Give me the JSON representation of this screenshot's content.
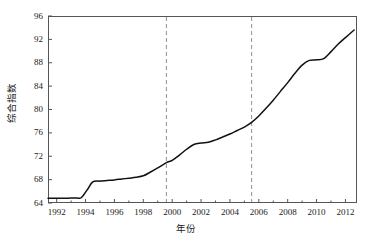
{
  "chart_data": {
    "type": "line",
    "title": "",
    "xlabel": "年份",
    "ylabel": "综合指数",
    "xlim": [
      1991.4,
      2012.8
    ],
    "ylim": [
      64,
      96
    ],
    "grid": false,
    "legend": null,
    "xticks": [
      1992,
      1994,
      1996,
      1998,
      2000,
      2002,
      2004,
      2006,
      2008,
      2010,
      2012
    ],
    "xtick_labels": [
      "1992",
      "1994",
      "1996",
      "1998",
      "2000",
      "2002",
      "2004",
      "2006",
      "2008",
      "2010",
      "2012"
    ],
    "yticks": [
      64,
      68,
      72,
      76,
      80,
      84,
      88,
      92,
      96
    ],
    "ytick_labels": [
      "64",
      "68",
      "72",
      "76",
      "80",
      "84",
      "88",
      "92",
      "96"
    ],
    "line_color": "#111111",
    "series": [
      {
        "name": "综合指数",
        "x": [
          1991.4,
          1992.0,
          1992.5,
          1993.0,
          1993.4,
          1993.7,
          1994.1,
          1994.5,
          1995.0,
          1995.5,
          1996.0,
          1996.5,
          1997.0,
          1997.5,
          1998.0,
          1998.5,
          1999.0,
          1999.6,
          2000.0,
          2000.5,
          2001.0,
          2001.5,
          2002.0,
          2002.5,
          2003.0,
          2003.5,
          2004.0,
          2004.5,
          2005.0,
          2005.5,
          2006.0,
          2006.5,
          2007.0,
          2007.5,
          2008.0,
          2008.5,
          2009.0,
          2009.5,
          2010.0,
          2010.5,
          2011.0,
          2011.5,
          2012.0,
          2012.6
        ],
        "y": [
          64.8,
          64.8,
          64.8,
          64.85,
          64.85,
          64.9,
          66.2,
          67.6,
          67.75,
          67.85,
          67.95,
          68.1,
          68.25,
          68.4,
          68.65,
          69.3,
          70.0,
          70.9,
          71.3,
          72.2,
          73.2,
          74.0,
          74.25,
          74.4,
          74.8,
          75.3,
          75.8,
          76.4,
          77.0,
          77.8,
          78.9,
          80.2,
          81.6,
          83.1,
          84.6,
          86.2,
          87.6,
          88.4,
          88.5,
          88.7,
          89.9,
          91.2,
          92.3,
          93.6
        ]
      }
    ],
    "annotations": [
      {
        "type": "vertical-dashed-line",
        "x": 1999.6,
        "color": "#9a9a9a"
      },
      {
        "type": "vertical-dashed-line",
        "x": 2005.5,
        "color": "#9a9a9a"
      }
    ]
  }
}
